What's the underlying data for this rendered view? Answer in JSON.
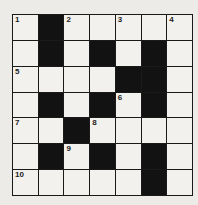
{
  "puzzle": {
    "rows": 7,
    "cols": 7,
    "colors": {
      "black": "#121212",
      "white": "#f2f1ee",
      "line": "#1a1a1a"
    },
    "grid": [
      [
        "W",
        "B",
        "W",
        "W",
        "W",
        "W",
        "W"
      ],
      [
        "W",
        "B",
        "W",
        "B",
        "W",
        "B",
        "W"
      ],
      [
        "W",
        "W",
        "W",
        "W",
        "B",
        "B",
        "W"
      ],
      [
        "W",
        "B",
        "W",
        "B",
        "W",
        "B",
        "W"
      ],
      [
        "W",
        "W",
        "B",
        "W",
        "W",
        "W",
        "W"
      ],
      [
        "W",
        "B",
        "W",
        "B",
        "W",
        "B",
        "W"
      ],
      [
        "W",
        "W",
        "W",
        "W",
        "W",
        "B",
        "W"
      ]
    ],
    "numbers": [
      {
        "row": 0,
        "col": 0,
        "n": "1"
      },
      {
        "row": 0,
        "col": 2,
        "n": "2"
      },
      {
        "row": 0,
        "col": 4,
        "n": "3"
      },
      {
        "row": 0,
        "col": 6,
        "n": "4"
      },
      {
        "row": 2,
        "col": 0,
        "n": "5"
      },
      {
        "row": 3,
        "col": 4,
        "n": "6"
      },
      {
        "row": 4,
        "col": 0,
        "n": "7"
      },
      {
        "row": 4,
        "col": 3,
        "n": "8"
      },
      {
        "row": 5,
        "col": 2,
        "n": "9"
      },
      {
        "row": 6,
        "col": 0,
        "n": "10"
      }
    ]
  }
}
